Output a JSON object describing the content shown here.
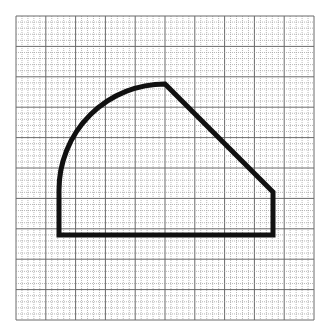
{
  "figure": {
    "grid": {
      "x0": 16,
      "y0": 16,
      "x1": 314,
      "y1": 320,
      "cols": 50,
      "rows": 50,
      "major_every": 5,
      "minor_color": "#9a9a9a",
      "major_color": "#6a6a6a"
    },
    "shape": {
      "stroke_color": "#111111",
      "stroke_width": 5,
      "points": {
        "bottom_left": [
          59,
          235
        ],
        "arc_start": [
          59,
          190
        ],
        "apex": [
          165,
          84
        ],
        "right_top": [
          273,
          192
        ],
        "bottom_right": [
          273,
          235
        ]
      },
      "arc_radius": 106
    }
  }
}
